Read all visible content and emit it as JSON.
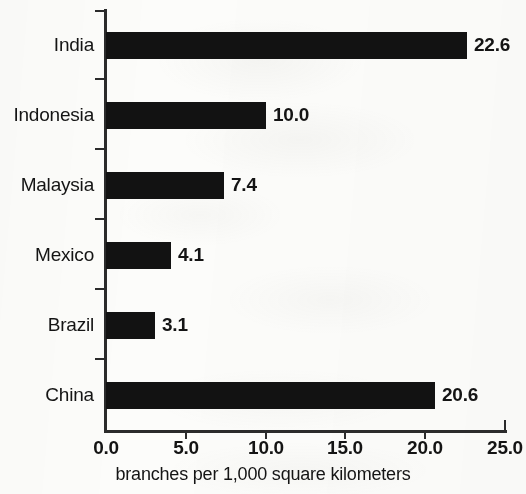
{
  "chart_data": {
    "type": "bar",
    "orientation": "horizontal",
    "title": "",
    "subtitle": "",
    "xlabel": "branches per 1,000 square kilometers",
    "ylabel": "",
    "categories": [
      "India",
      "Indonesia",
      "Malaysia",
      "Mexico",
      "Brazil",
      "China"
    ],
    "values": [
      22.6,
      10.0,
      7.4,
      4.1,
      3.1,
      20.6
    ],
    "value_labels": [
      "22.6",
      "10.0",
      "7.4",
      "4.1",
      "3.1",
      "20.6"
    ],
    "xlim": [
      0.0,
      25.0
    ],
    "xticks": [
      0.0,
      5.0,
      10.0,
      15.0,
      20.0,
      25.0
    ],
    "xtick_labels": [
      "0.0",
      "5.0",
      "10.0",
      "15.0",
      "20.0",
      "25.0"
    ],
    "grid": false,
    "legend": false,
    "bar_color": "#121212",
    "axis_color": "#2b2b2b",
    "text_color": "#141414",
    "background_color": "#fcfcfa"
  },
  "bars": [
    {
      "category": "India",
      "value": 22.6,
      "label": "22.6"
    },
    {
      "category": "Indonesia",
      "value": 10.0,
      "label": "10.0"
    },
    {
      "category": "Malaysia",
      "value": 7.4,
      "label": "7.4"
    },
    {
      "category": "Mexico",
      "value": 4.1,
      "label": "4.1"
    },
    {
      "category": "Brazil",
      "value": 3.1,
      "label": "3.1"
    },
    {
      "category": "China",
      "value": 20.6,
      "label": "20.6"
    }
  ]
}
